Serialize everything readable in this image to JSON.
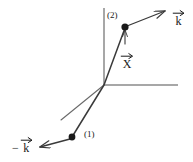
{
  "figure": {
    "background_color": "#ffffff",
    "stroke_color": "#3a3a3a",
    "axis_color": "#6e6e6e",
    "text_color": "#1a1a1a",
    "width": 193,
    "height": 162
  },
  "axes": {
    "origin": {
      "x": 104,
      "y": 85
    },
    "vertical": {
      "x1": 104,
      "y1": 8,
      "x2": 104,
      "y2": 85
    },
    "horizontal": {
      "x1": 104,
      "y1": 85,
      "x2": 178,
      "y2": 85
    }
  },
  "points": [
    {
      "id": "point-1",
      "label": "(1)",
      "dot": {
        "x": 72,
        "y": 137,
        "r": 3.4
      },
      "label_pos": {
        "x": 84,
        "y": 131
      }
    },
    {
      "id": "point-2",
      "label": "(2)",
      "dot": {
        "x": 125,
        "y": 27,
        "r": 3.6
      },
      "label_pos": {
        "x": 108,
        "y": 12
      }
    }
  ],
  "paths": {
    "trajectory": {
      "x1": 72,
      "y1": 137,
      "x2": 104,
      "y2": 85,
      "x3": 125,
      "y3": 27
    },
    "secondary_ray": {
      "x1": 104,
      "y1": 85,
      "x2": 61,
      "y2": 120
    }
  },
  "vectors": [
    {
      "id": "k-positive",
      "symbol": "k",
      "sign": "",
      "label_pos": {
        "x": 172,
        "y": 10
      },
      "arrow": {
        "x1": 127,
        "y1": 26,
        "x2": 166,
        "y2": 10
      }
    },
    {
      "id": "k-negative",
      "symbol": "k",
      "sign": "−",
      "label_pos": {
        "x": 14,
        "y": 138
      },
      "arrow": {
        "x1": 70,
        "y1": 139,
        "x2": 38,
        "y2": 148
      }
    },
    {
      "id": "x-vector",
      "symbol": "X",
      "sign": "",
      "label_pos": {
        "x": 121,
        "y": 53
      },
      "arrow": {
        "x1": 125,
        "y1": 43,
        "x2": 125,
        "y2": 28
      }
    }
  ]
}
